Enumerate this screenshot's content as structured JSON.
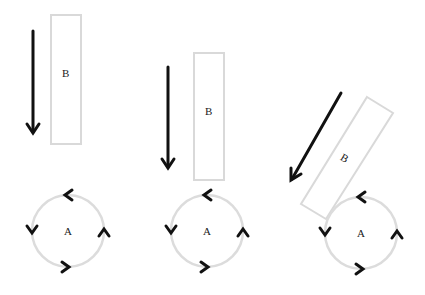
{
  "diagram": {
    "colors": {
      "block_stroke": "#d9d9d9",
      "circle_stroke": "#dcdcdc",
      "arrow": "#111111",
      "text": "#222222"
    },
    "panels": [
      {
        "id": "panel-1",
        "block_label": "B",
        "circle_label": "A",
        "motion": "downward",
        "rotation": "counterclockwise"
      },
      {
        "id": "panel-2",
        "block_label": "B",
        "circle_label": "A",
        "motion": "downward",
        "rotation": "counterclockwise"
      },
      {
        "id": "panel-3",
        "block_label": "B",
        "circle_label": "A",
        "motion": "diagonal-down-left",
        "rotation": "counterclockwise"
      }
    ]
  }
}
